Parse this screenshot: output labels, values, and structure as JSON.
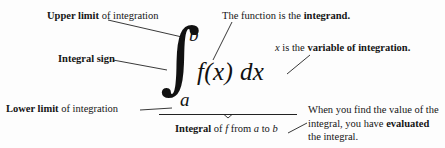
{
  "figure": {
    "background_color": "#fdfdfd",
    "ink_color": "#151515"
  },
  "formula": {
    "integral_sign": "∫",
    "upper_bound": "b",
    "lower_bound": "a",
    "integrand": "f(x) dx",
    "reading": "integral of f from a to b"
  },
  "labels": {
    "upper_limit": {
      "bold": "Upper limit",
      "rest": " of integration"
    },
    "integral_sign": {
      "bold": "Integral sign",
      "rest": ""
    },
    "lower_limit": {
      "bold": "Lower limit",
      "rest": " of integration"
    },
    "integrand": {
      "lead": "The function is the ",
      "bold": "integrand."
    },
    "variable": {
      "lead_italic": "x",
      "lead": " is the ",
      "bold": "variable of integration."
    },
    "brace": {
      "bold": "Integral",
      "mid": " of ",
      "italic_f": "f",
      "mid2": " from ",
      "italic_a": "a",
      "mid3": " to ",
      "italic_b": "b"
    },
    "evaluated": {
      "line1": "When you find the value",
      "line2": "of the integral, you have ",
      "bold": "evaluated",
      "line3": " the integral."
    }
  }
}
